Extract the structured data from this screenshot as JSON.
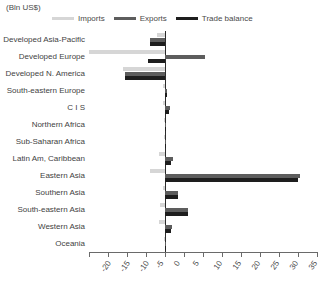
{
  "units_label": "(Bln US$)",
  "legend": {
    "items": [
      {
        "label": "Imports",
        "color": "#d6d6d6",
        "key": "imports"
      },
      {
        "label": "Exports",
        "color": "#5d5d5d",
        "key": "exports"
      },
      {
        "label": "Trade balance",
        "color": "#1e1e1e",
        "key": "trade_balance"
      }
    ]
  },
  "chart_data": {
    "type": "bar",
    "orientation": "horizontal",
    "title": "",
    "subtitle": "",
    "xlabel": "(Bln US$)",
    "ylabel": "",
    "xlim": [
      -20,
      40
    ],
    "xticks": [
      -20,
      -15,
      -10,
      -5,
      0,
      5,
      10,
      15,
      20,
      25,
      30,
      35,
      40
    ],
    "xtick_labels": [
      "-20",
      "-15",
      "-10",
      "-5",
      "0",
      "5",
      "10",
      "15",
      "20",
      "25",
      "30",
      "35",
      "40"
    ],
    "grid": false,
    "legend_position": "top",
    "categories": [
      "Developed Asia-Pacific",
      "Developed Europe",
      "Developed N. America",
      "South-eastern Europe",
      "C I S",
      "Northern Africa",
      "Sub-Saharan Africa",
      "Latin Am, Caribbean",
      "Eastern Asia",
      "Southern Asia",
      "South-eastern Asia",
      "Western Asia",
      "Oceania"
    ],
    "series": [
      {
        "name": "Imports",
        "color": "#d6d6d6",
        "values": [
          -2.0,
          -20.0,
          -11.0,
          -0.4,
          -0.5,
          -0.2,
          -0.2,
          -1.5,
          -4.0,
          -0.6,
          -1.2,
          -1.5,
          -0.2
        ]
      },
      {
        "name": "Exports",
        "color": "#5d5d5d",
        "values": [
          -4.0,
          10.5,
          -10.5,
          0.6,
          1.2,
          0.3,
          0.3,
          2.0,
          35.5,
          3.5,
          6.0,
          1.8,
          0.3
        ]
      },
      {
        "name": "Trade balance",
        "color": "#1e1e1e",
        "values": [
          -4.0,
          -4.5,
          -10.5,
          0.5,
          1.0,
          0.2,
          0.2,
          1.5,
          35.0,
          3.5,
          6.0,
          1.5,
          0.2
        ]
      }
    ]
  }
}
